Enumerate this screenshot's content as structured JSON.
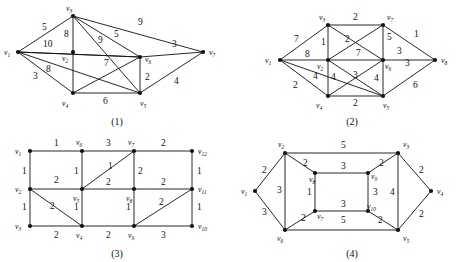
{
  "figure": {
    "panel_count": 4,
    "captions": [
      "(1)",
      "(2)",
      "(3)",
      "(4)"
    ]
  },
  "graphs": [
    {
      "id": "graph-1",
      "caption": "(1)",
      "vertex_labels": [
        "v1",
        "v2",
        "v3",
        "v4",
        "v5",
        "v6",
        "v7"
      ],
      "vertices": [
        {
          "name": "v1",
          "sub": "1",
          "x": 18,
          "y": 52
        },
        {
          "name": "v2",
          "sub": "2",
          "x": 73,
          "y": 52
        },
        {
          "name": "v3",
          "sub": "3",
          "x": 73,
          "y": 16
        },
        {
          "name": "v4",
          "sub": "4",
          "x": 73,
          "y": 93
        },
        {
          "name": "v5",
          "sub": "5",
          "x": 140,
          "y": 93
        },
        {
          "name": "v6",
          "sub": "6",
          "x": 140,
          "y": 57
        },
        {
          "name": "v7",
          "sub": "7",
          "x": 203,
          "y": 52
        }
      ],
      "edges": [
        {
          "from": "v1",
          "to": "v3",
          "weight": "5",
          "lx": 42,
          "ly": 30
        },
        {
          "from": "v1",
          "to": "v2",
          "weight": "10",
          "lx": 47,
          "ly": 45
        },
        {
          "from": "v1",
          "to": "v6",
          "weight": "8",
          "lx": 48,
          "ly": 70
        },
        {
          "from": "v1",
          "to": "v4",
          "weight": "3",
          "lx": 38,
          "ly": 78
        },
        {
          "from": "v3",
          "to": "v4",
          "weight": "8",
          "lx": 65,
          "ly": 35
        },
        {
          "from": "v3",
          "to": "v6",
          "weight": "5",
          "lx": 116,
          "ly": 35
        },
        {
          "from": "v3",
          "to": "v5",
          "weight": "9",
          "lx": 100,
          "ly": 42
        },
        {
          "from": "v3",
          "to": "v7",
          "weight": "9",
          "lx": 140,
          "ly": 23
        },
        {
          "from": "v4",
          "to": "v6",
          "weight": "7",
          "lx": 106,
          "ly": 64
        },
        {
          "from": "v4",
          "to": "v5",
          "weight": "6",
          "lx": 105,
          "ly": 99
        },
        {
          "from": "v5",
          "to": "v6",
          "weight": "2",
          "lx": 146,
          "ly": 77
        },
        {
          "from": "v5",
          "to": "v7",
          "weight": "4",
          "lx": 175,
          "ly": 82
        },
        {
          "from": "v6",
          "to": "v7",
          "weight": "3",
          "lx": 172,
          "ly": 45
        }
      ]
    },
    {
      "id": "graph-2",
      "caption": "(2)",
      "vertex_labels": [
        "v1",
        "v2",
        "v3",
        "v4",
        "v5",
        "v6",
        "v7",
        "v8"
      ],
      "vertices": [
        {
          "name": "v1",
          "sub": "1",
          "x": 45,
          "y": 60
        },
        {
          "name": "v2",
          "sub": "2",
          "x": 93,
          "y": 60
        },
        {
          "name": "v3",
          "sub": "3",
          "x": 93,
          "y": 25
        },
        {
          "name": "v4",
          "sub": "4",
          "x": 93,
          "y": 96
        },
        {
          "name": "v5",
          "sub": "5",
          "x": 148,
          "y": 96
        },
        {
          "name": "v6",
          "sub": "6",
          "x": 148,
          "y": 60
        },
        {
          "name": "v7",
          "sub": "7",
          "x": 148,
          "y": 25
        },
        {
          "name": "v8",
          "sub": "8",
          "x": 200,
          "y": 60
        }
      ],
      "edges": [
        {
          "from": "v1",
          "to": "v3",
          "weight": "7",
          "lx": 62,
          "ly": 40
        },
        {
          "from": "v1",
          "to": "v2",
          "weight": "8",
          "lx": 73,
          "ly": 56
        },
        {
          "from": "v1",
          "to": "v4",
          "weight": "2",
          "lx": 62,
          "ly": 85
        },
        {
          "from": "v1",
          "to": "v5",
          "weight": "4",
          "lx": 80,
          "ly": 77
        },
        {
          "from": "v3",
          "to": "v7",
          "weight": "2",
          "lx": 119,
          "ly": 20
        },
        {
          "from": "v3",
          "to": "v2",
          "weight": "1",
          "lx": 88,
          "ly": 42
        },
        {
          "from": "v3",
          "to": "v6",
          "weight": "2",
          "lx": 110,
          "ly": 40
        },
        {
          "from": "v2",
          "to": "v7",
          "weight": "5",
          "lx": 152,
          "ly": 38
        },
        {
          "from": "v2",
          "to": "v6",
          "weight": "7",
          "lx": 123,
          "ly": 55
        },
        {
          "from": "v2",
          "to": "v4",
          "weight": "4",
          "lx": 98,
          "ly": 78
        },
        {
          "from": "v2",
          "to": "v5",
          "weight": "3",
          "lx": 119,
          "ly": 76
        },
        {
          "from": "v4",
          "to": "v6",
          "weight": "4",
          "lx": 139,
          "ly": 79
        },
        {
          "from": "v4",
          "to": "v5",
          "weight": "2",
          "lx": 119,
          "ly": 103
        },
        {
          "from": "v7",
          "to": "v8",
          "weight": "1",
          "lx": 180,
          "ly": 36
        },
        {
          "from": "v7",
          "to": "v6",
          "weight": "5",
          "lx": 153,
          "ly": 38
        },
        {
          "from": "v6",
          "to": "v8",
          "weight": "3",
          "lx": 172,
          "ly": 65
        },
        {
          "from": "v7",
          "to": "v8b",
          "weight": "3",
          "lx": 163,
          "ly": 52
        },
        {
          "from": "v5",
          "to": "v8",
          "weight": "6",
          "lx": 180,
          "ly": 86
        }
      ]
    },
    {
      "id": "graph-3",
      "caption": "(3)",
      "vertex_labels": [
        "v1",
        "v2",
        "v3",
        "v4",
        "v5",
        "v6",
        "v7",
        "v8",
        "v9",
        "v10",
        "v11",
        "v12"
      ],
      "vertices": [
        {
          "name": "v1",
          "sub": "1",
          "x": 30,
          "y": 20
        },
        {
          "name": "v6",
          "sub": "6",
          "x": 82,
          "y": 20
        },
        {
          "name": "v7",
          "sub": "7",
          "x": 134,
          "y": 20
        },
        {
          "name": "v12",
          "sub": "12",
          "x": 192,
          "y": 20
        },
        {
          "name": "v2",
          "sub": "2",
          "x": 30,
          "y": 58
        },
        {
          "name": "v5",
          "sub": "5",
          "x": 82,
          "y": 58
        },
        {
          "name": "v8",
          "sub": "8",
          "x": 134,
          "y": 58
        },
        {
          "name": "v11",
          "sub": "11",
          "x": 192,
          "y": 58
        },
        {
          "name": "v3",
          "sub": "3",
          "x": 30,
          "y": 95
        },
        {
          "name": "v4",
          "sub": "4",
          "x": 82,
          "y": 95
        },
        {
          "name": "v9",
          "sub": "9",
          "x": 134,
          "y": 95
        },
        {
          "name": "v10",
          "sub": "10",
          "x": 192,
          "y": 95
        }
      ],
      "edges": [
        {
          "from": "v1",
          "to": "v6",
          "weight": "1",
          "lx": 56,
          "ly": 14
        },
        {
          "from": "v6",
          "to": "v7",
          "weight": "3",
          "lx": 108,
          "ly": 14
        },
        {
          "from": "v7",
          "to": "v12",
          "weight": "2",
          "lx": 163,
          "ly": 14
        },
        {
          "from": "v1",
          "to": "v2",
          "weight": "1",
          "lx": 24,
          "ly": 42
        },
        {
          "from": "v6",
          "to": "v5",
          "weight": "1",
          "lx": 76,
          "ly": 42
        },
        {
          "from": "v7",
          "to": "v8",
          "weight": "2",
          "lx": 140,
          "ly": 42
        },
        {
          "from": "v12",
          "to": "v11",
          "weight": "1",
          "lx": 198,
          "ly": 42
        },
        {
          "from": "v5",
          "to": "v7",
          "weight": "1",
          "lx": 110,
          "ly": 36
        },
        {
          "from": "v2",
          "to": "v5",
          "weight": "2",
          "lx": 56,
          "ly": 50
        },
        {
          "from": "v5",
          "to": "v8",
          "weight": "2",
          "lx": 108,
          "ly": 51
        },
        {
          "from": "v8",
          "to": "v11",
          "weight": "2",
          "lx": 163,
          "ly": 51
        },
        {
          "from": "v2",
          "to": "v3",
          "weight": "1",
          "lx": 24,
          "ly": 78
        },
        {
          "from": "v2",
          "to": "v4",
          "weight": "2",
          "lx": 52,
          "ly": 77
        },
        {
          "from": "v5",
          "to": "v4",
          "weight": "1",
          "lx": 76,
          "ly": 78
        },
        {
          "from": "v8",
          "to": "v9",
          "weight": "1",
          "lx": 128,
          "ly": 78
        },
        {
          "from": "v9",
          "to": "v11",
          "weight": "2",
          "lx": 160,
          "ly": 73
        },
        {
          "from": "v11",
          "to": "v10",
          "weight": "1",
          "lx": 198,
          "ly": 78
        },
        {
          "from": "v3",
          "to": "v4",
          "weight": "2",
          "lx": 56,
          "ly": 105
        },
        {
          "from": "v4",
          "to": "v9",
          "weight": "2",
          "lx": 108,
          "ly": 105
        },
        {
          "from": "v9",
          "to": "v10",
          "weight": "3",
          "lx": 163,
          "ly": 105
        }
      ]
    },
    {
      "id": "graph-4",
      "caption": "(4)",
      "vertex_labels": [
        "v1",
        "v2",
        "v3",
        "v4",
        "v5",
        "v6",
        "v7",
        "v8",
        "v9",
        "v10"
      ],
      "vertices": [
        {
          "name": "v1",
          "sub": "1",
          "x": 20,
          "y": 60
        },
        {
          "name": "v2",
          "sub": "2",
          "x": 50,
          "y": 22
        },
        {
          "name": "v6",
          "sub": "6",
          "x": 50,
          "y": 99
        },
        {
          "name": "v8",
          "sub": "8",
          "x": 80,
          "y": 42
        },
        {
          "name": "v7",
          "sub": "7",
          "x": 80,
          "y": 80
        },
        {
          "name": "v9",
          "sub": "9",
          "x": 133,
          "y": 42
        },
        {
          "name": "v10",
          "sub": "10",
          "x": 133,
          "y": 80
        },
        {
          "name": "v3",
          "sub": "3",
          "x": 163,
          "y": 22
        },
        {
          "name": "v5",
          "sub": "5",
          "x": 163,
          "y": 99
        },
        {
          "name": "v4",
          "sub": "4",
          "x": 196,
          "y": 60
        }
      ],
      "edges": [
        {
          "from": "v1",
          "to": "v2",
          "weight": "2",
          "lx": 29,
          "ly": 40
        },
        {
          "from": "v1",
          "to": "v6",
          "weight": "3",
          "lx": 29,
          "ly": 82
        },
        {
          "from": "v2",
          "to": "v3",
          "weight": "5",
          "lx": 108,
          "ly": 16
        },
        {
          "from": "v2",
          "to": "v6",
          "weight": "3",
          "lx": 44,
          "ly": 60
        },
        {
          "from": "v2",
          "to": "v8",
          "weight": "2",
          "lx": 70,
          "ly": 33
        },
        {
          "from": "v8",
          "to": "v9",
          "weight": "3",
          "lx": 108,
          "ly": 36
        },
        {
          "from": "v8",
          "to": "v7",
          "weight": "1",
          "lx": 73,
          "ly": 62
        },
        {
          "from": "v7",
          "to": "v10",
          "weight": "3",
          "lx": 108,
          "ly": 74
        },
        {
          "from": "v9",
          "to": "v10",
          "weight": "3",
          "lx": 139,
          "ly": 62
        },
        {
          "from": "v9",
          "to": "v3",
          "weight": "2",
          "lx": 146,
          "ly": 33
        },
        {
          "from": "v3",
          "to": "v5",
          "weight": "4",
          "lx": 157,
          "ly": 62
        },
        {
          "from": "v3",
          "to": "v4",
          "weight": "2",
          "lx": 184,
          "ly": 40
        },
        {
          "from": "v4",
          "to": "v5",
          "weight": "2",
          "lx": 184,
          "ly": 84
        },
        {
          "from": "v10",
          "to": "v5",
          "weight": "2",
          "lx": 144,
          "ly": 90
        },
        {
          "from": "v6",
          "to": "v7",
          "weight": "2",
          "lx": 68,
          "ly": 90
        },
        {
          "from": "v6",
          "to": "v5",
          "weight": "5",
          "lx": 108,
          "ly": 90
        }
      ]
    }
  ]
}
